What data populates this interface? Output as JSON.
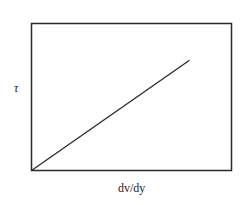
{
  "chart_data": {
    "type": "line",
    "title": "",
    "xlabel": "dv/dy",
    "ylabel": "τ",
    "grid": false,
    "legend": null,
    "x_ticks": [],
    "y_ticks": [],
    "series": [
      {
        "name": "τ vs dv/dy",
        "x": [
          0,
          0.79
        ],
        "y": [
          0,
          0.75
        ]
      }
    ],
    "xlim": [
      0,
      1
    ],
    "ylim": [
      0,
      1
    ],
    "annotations": []
  },
  "colors": {
    "frame": "#2a2a2a",
    "line": "#2a2a2a",
    "background": "#ffffff"
  }
}
